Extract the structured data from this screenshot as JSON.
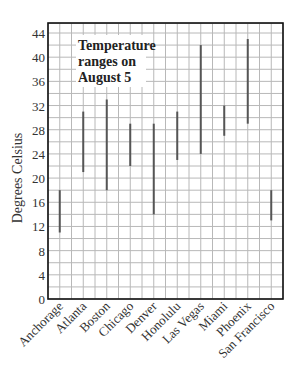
{
  "chart_data": {
    "type": "range-bar",
    "title": "",
    "annotation": [
      "Temperature",
      "ranges on",
      "August 5"
    ],
    "xlabel": "",
    "ylabel": "Degrees Celsius",
    "ylim": [
      0,
      44
    ],
    "y_ticks": [
      0,
      4,
      8,
      12,
      16,
      20,
      24,
      28,
      32,
      36,
      40,
      44
    ],
    "y_minor_step": 2,
    "grid": true,
    "legend": "none",
    "categories": [
      "Anchorage",
      "Atlanta",
      "Boston",
      "Chicago",
      "Denver",
      "Honolulu",
      "Las Vegas",
      "Miami",
      "Phoenix",
      "San Francisco"
    ],
    "series": [
      {
        "name": "Low",
        "values": [
          11,
          21,
          18,
          22,
          14,
          23,
          24,
          27,
          29,
          13
        ]
      },
      {
        "name": "High",
        "values": [
          18,
          31,
          33,
          29,
          29,
          31,
          42,
          32,
          43,
          18
        ]
      }
    ],
    "colors": {
      "grid": "#b8b8b8",
      "axis": "#111111",
      "bar": "#555555",
      "background": "#ffffff"
    }
  }
}
